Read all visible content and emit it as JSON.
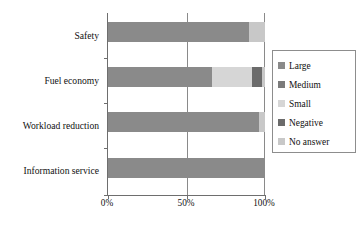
{
  "chart_data": {
    "type": "bar",
    "orientation": "horizontal",
    "stacked": true,
    "normalized_percent": true,
    "title": "",
    "xlabel": "",
    "ylabel": "",
    "xlim": [
      0,
      100
    ],
    "grid": true,
    "gridlines_x": [
      0,
      50,
      100
    ],
    "legend_position": "right",
    "categories": [
      "Safety",
      "Fuel economy",
      "Workload reduction",
      "Information service"
    ],
    "x_tick_labels": [
      "0%",
      "50%",
      "100%"
    ],
    "x_tick_values": [
      0,
      50,
      100
    ],
    "series": [
      {
        "name": "Large",
        "color": "#8a8a8a",
        "values": [
          90,
          66,
          96,
          100
        ]
      },
      {
        "name": "Medium",
        "color": "#7b7b7b",
        "values": [
          0,
          0,
          0,
          0
        ]
      },
      {
        "name": "Small",
        "color": "#d6d6d6",
        "values": [
          0,
          26,
          0,
          0
        ]
      },
      {
        "name": "Negative",
        "color": "#6b6b6b",
        "values": [
          0,
          6,
          0,
          0
        ]
      },
      {
        "name": "No answer",
        "color": "#c8c8c8",
        "values": [
          10,
          2,
          4,
          0
        ]
      }
    ]
  },
  "legend": {
    "items": [
      {
        "label": "Large",
        "color": "#8a8a8a"
      },
      {
        "label": "Medium",
        "color": "#7b7b7b"
      },
      {
        "label": "Small",
        "color": "#d6d6d6"
      },
      {
        "label": "Negative",
        "color": "#6b6b6b"
      },
      {
        "label": "No answer",
        "color": "#c8c8c8"
      }
    ]
  },
  "axes": {
    "x_labels": [
      "0%",
      "50%",
      "100%"
    ],
    "y_labels": [
      "Safety",
      "Fuel economy",
      "Workload reduction",
      "Information service"
    ]
  },
  "style": {
    "axis_color": "#6e6e6e",
    "grid_color": "#8a8a8a",
    "legend_border": "#8d8d8d",
    "background": "#ffffff",
    "text_color": "#111111"
  }
}
